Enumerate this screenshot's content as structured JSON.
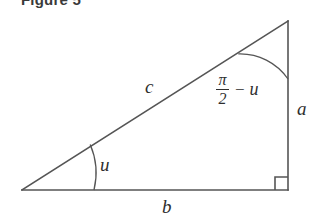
{
  "figure": {
    "caption": "Figure 5",
    "background_color": "#ffffff",
    "line_color": "#555555",
    "text_color": "#2e2e2e"
  },
  "labels": {
    "hypotenuse": "c",
    "opposite_side": "a",
    "adjacent_side": "b",
    "base_angle": "u",
    "apex_angle_numerator": "π",
    "apex_angle_denominator": "2",
    "apex_angle_operator": "−",
    "apex_angle_variable": "u"
  },
  "geometry": {
    "left_vertex": [
      22,
      190
    ],
    "right_angle_vertex": [
      288,
      190
    ],
    "apex_vertex": [
      288,
      21
    ],
    "right_angle_marker_size": 13,
    "base_arc_radius": 72,
    "apex_arc_radius": 58
  }
}
